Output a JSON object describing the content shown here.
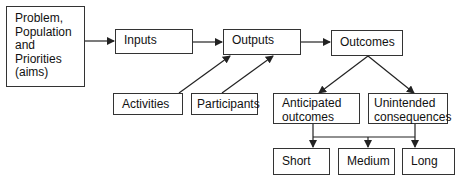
{
  "diagram": {
    "type": "logic-model-flowchart",
    "nodes": {
      "problem": {
        "lines": [
          "Problem,",
          "Population",
          "and",
          "Priorities",
          "(aims)"
        ]
      },
      "inputs": {
        "label": "Inputs"
      },
      "outputs": {
        "label": "Outputs"
      },
      "outcomes": {
        "label": "Outcomes"
      },
      "activities": {
        "label": "Activities"
      },
      "participants": {
        "label": "Participants"
      },
      "anticipated": {
        "lines": [
          "Anticipated",
          "outcomes"
        ]
      },
      "unintended": {
        "lines": [
          "Unintended",
          "consequences"
        ]
      },
      "short": {
        "label": "Short"
      },
      "medium": {
        "label": "Medium"
      },
      "long": {
        "label": "Long"
      }
    },
    "edges": [
      {
        "from": "problem",
        "to": "inputs"
      },
      {
        "from": "inputs",
        "to": "outputs"
      },
      {
        "from": "activities",
        "to": "outputs"
      },
      {
        "from": "participants",
        "to": "outputs"
      },
      {
        "from": "outputs",
        "to": "outcomes"
      },
      {
        "from": "outcomes",
        "to": "anticipated"
      },
      {
        "from": "outcomes",
        "to": "unintended"
      },
      {
        "from": [
          "anticipated",
          "unintended"
        ],
        "to": "short"
      },
      {
        "from": [
          "anticipated",
          "unintended"
        ],
        "to": "medium"
      },
      {
        "from": [
          "anticipated",
          "unintended"
        ],
        "to": "long"
      }
    ],
    "colors": {
      "line": "#222222",
      "border": "#333333",
      "background": "#ffffff"
    }
  }
}
